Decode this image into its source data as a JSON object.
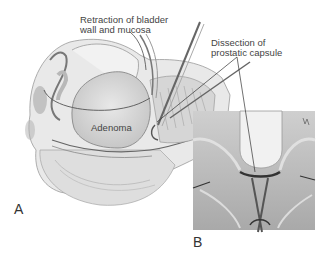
{
  "figure": {
    "panels": [
      {
        "id": "A",
        "letter": "A"
      },
      {
        "id": "B",
        "letter": "B"
      }
    ],
    "labels": {
      "retraction": "Retraction of bladder\nwall and mucosa",
      "dissection": "Dissection of\nprostatic capsule",
      "adenoma": "Adenoma"
    }
  }
}
